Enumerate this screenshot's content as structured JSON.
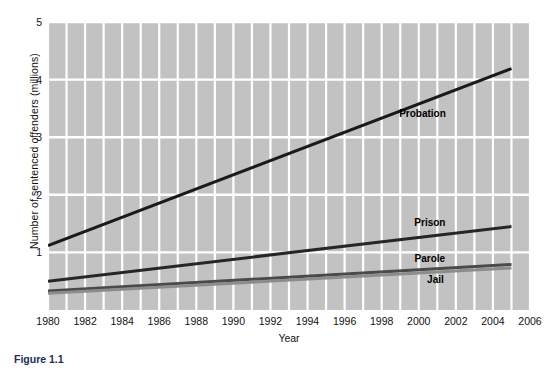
{
  "figure": {
    "caption": "Figure 1.1"
  },
  "chart_data": {
    "type": "line",
    "title": "",
    "xlabel": "Year",
    "ylabel": "Number of sentenced offenders (millions)",
    "xlim": [
      1980,
      2006
    ],
    "ylim": [
      0,
      5
    ],
    "yticks": [
      1,
      2,
      3,
      4,
      5
    ],
    "xticks": [
      1980,
      1982,
      1984,
      1986,
      1988,
      1990,
      1992,
      1994,
      1996,
      1998,
      2000,
      2002,
      2004,
      2006
    ],
    "grid": true,
    "grid_color": "#ffffff",
    "plot_background": "#c2c2c2",
    "legend_position": "inline-annotations",
    "x": [
      1980,
      2005
    ],
    "series": [
      {
        "name": "Probation",
        "values": [
          1.12,
          4.19
        ],
        "color": "#1a1a1a",
        "label_x": 2000.2,
        "label_y": 3.42
      },
      {
        "name": "Prison",
        "values": [
          0.5,
          1.45
        ],
        "color": "#262626",
        "label_x": 2000.6,
        "label_y": 1.52
      },
      {
        "name": "Parole",
        "values": [
          0.33,
          0.79
        ],
        "color": "#4a4a4a",
        "label_x": 2000.6,
        "label_y": 0.9
      },
      {
        "name": "Jail",
        "values": [
          0.29,
          0.73
        ],
        "color": "#8c8c8c",
        "label_x": 2000.9,
        "label_y": 0.53
      }
    ]
  }
}
